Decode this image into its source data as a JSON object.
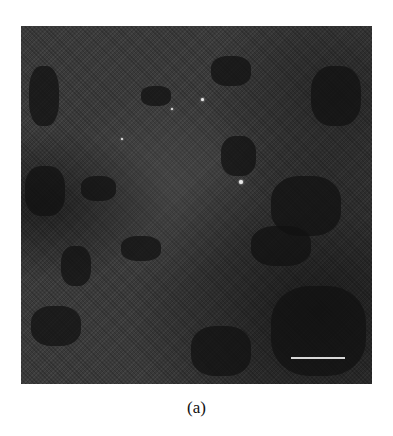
{
  "figure": {
    "panel_label": "(a)",
    "image_type": "grayscale micrograph",
    "scale_bar": {
      "color": "#d8d8d8",
      "label": ""
    },
    "colors": {
      "background": "#3a3a3a",
      "dark_regions": "#111111",
      "bright_spots": "#e8e8e8"
    }
  }
}
